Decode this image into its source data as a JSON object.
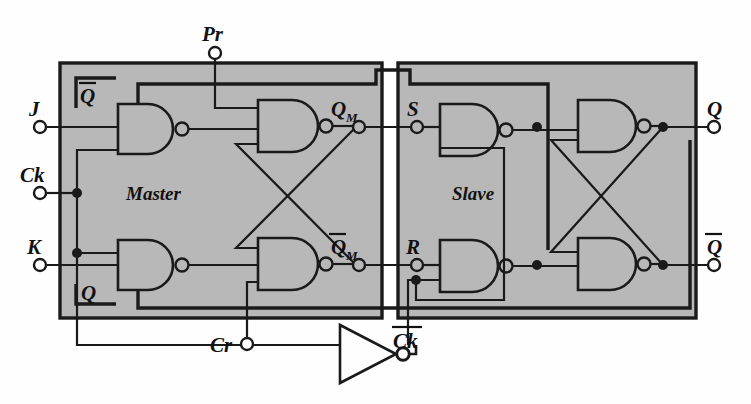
{
  "figure": {
    "type": "logic-circuit-diagram",
    "background_color": "#fefefe",
    "block_fill_color": "#b8b8b8",
    "line_color": "#1a1a1a"
  },
  "blocks": [
    {
      "id": "master",
      "label": "Master",
      "x": 60,
      "y": 63,
      "w": 322,
      "h": 255
    },
    {
      "id": "slave",
      "label": "Slave",
      "x": 398,
      "y": 63,
      "w": 298,
      "h": 255
    }
  ],
  "terminals": [
    {
      "name": "J",
      "label": "J",
      "x": 38,
      "y": 127,
      "side": "left"
    },
    {
      "name": "Ck",
      "label": "Ck",
      "x": 38,
      "y": 193,
      "side": "left"
    },
    {
      "name": "K",
      "label": "K",
      "x": 38,
      "y": 265,
      "side": "left"
    },
    {
      "name": "Pr",
      "label": "Pr",
      "x": 215,
      "y": 52,
      "side": "top"
    },
    {
      "name": "Cr",
      "label": "Cr",
      "x": 247,
      "y": 345,
      "side": "bottom"
    },
    {
      "name": "Ck-bar",
      "label": "Ck",
      "x": 322,
      "y": 345,
      "side": "bottom",
      "overbar": true
    },
    {
      "name": "Q-out",
      "label": "Q",
      "x": 716,
      "y": 127,
      "side": "right"
    },
    {
      "name": "Qbar-out",
      "label": "Q",
      "x": 716,
      "y": 265,
      "side": "right",
      "overbar": true
    }
  ],
  "internal_nodes": [
    {
      "name": "QM",
      "label": "Q",
      "sub": "M",
      "x": 356,
      "y": 127,
      "overbar": false
    },
    {
      "name": "QM-bar",
      "label": "Q",
      "sub": "M",
      "x": 356,
      "y": 265,
      "overbar": true
    },
    {
      "name": "S",
      "label": "S",
      "sub": "",
      "x": 416,
      "y": 127,
      "overbar": false
    },
    {
      "name": "R",
      "label": "R",
      "sub": "",
      "x": 416,
      "y": 265,
      "overbar": false
    }
  ],
  "feedback_labels": [
    {
      "name": "Qbar-feedback",
      "label": "Q",
      "overbar": true,
      "x": 88,
      "y": 92
    },
    {
      "name": "Q-feedback",
      "label": "Q",
      "overbar": false,
      "x": 88,
      "y": 290
    }
  ],
  "gates": [
    {
      "id": "m1",
      "type": "NAND",
      "inputs": 3,
      "x": 118,
      "y": 104,
      "w": 58,
      "h": 50,
      "section": "master",
      "role": "j-input-nand"
    },
    {
      "id": "m2",
      "type": "NAND",
      "inputs": 3,
      "x": 258,
      "y": 100,
      "w": 62,
      "h": 52,
      "section": "master",
      "role": "q-latch-nand"
    },
    {
      "id": "m3",
      "type": "NAND",
      "inputs": 3,
      "x": 118,
      "y": 240,
      "w": 58,
      "h": 50,
      "section": "master",
      "role": "k-input-nand"
    },
    {
      "id": "m4",
      "type": "NAND",
      "inputs": 3,
      "x": 258,
      "y": 238,
      "w": 62,
      "h": 52,
      "section": "master",
      "role": "qbar-latch-nand"
    },
    {
      "id": "s1",
      "type": "NAND",
      "inputs": 2,
      "x": 440,
      "y": 104,
      "w": 62,
      "h": 50,
      "section": "slave",
      "role": "s-input-nand"
    },
    {
      "id": "s2",
      "type": "NAND",
      "inputs": 2,
      "x": 578,
      "y": 100,
      "w": 62,
      "h": 52,
      "section": "slave",
      "role": "q-latch-nand"
    },
    {
      "id": "s3",
      "type": "NAND",
      "inputs": 2,
      "x": 440,
      "y": 240,
      "w": 62,
      "h": 50,
      "section": "slave",
      "role": "r-input-nand"
    },
    {
      "id": "s4",
      "type": "NAND",
      "inputs": 2,
      "x": 578,
      "y": 238,
      "w": 62,
      "h": 52,
      "section": "slave",
      "role": "qbar-latch-nand"
    },
    {
      "id": "inv",
      "type": "INVERTER",
      "inputs": 1,
      "x": 340,
      "y": 325,
      "w": 62,
      "h": 58,
      "section": "clock",
      "role": "clock-inverter"
    }
  ],
  "junction_dots": [
    {
      "name": "ck-tap-top",
      "x": 77,
      "y": 193
    },
    {
      "name": "ck-tap-bottom",
      "x": 77,
      "y": 253
    },
    {
      "name": "s-node-dot",
      "x": 537,
      "y": 127
    },
    {
      "name": "q-out-dot",
      "x": 663,
      "y": 127
    },
    {
      "name": "r-node-dot",
      "x": 537,
      "y": 265
    },
    {
      "name": "qbar-out-dot",
      "x": 663,
      "y": 265
    },
    {
      "name": "r-clock-dot",
      "x": 416,
      "y": 280
    }
  ]
}
